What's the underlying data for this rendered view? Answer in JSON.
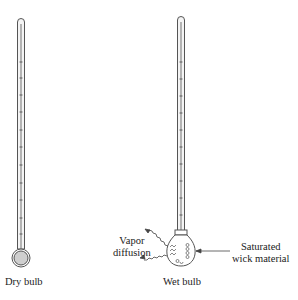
{
  "diagram": {
    "labels": {
      "dry_bulb": "Dry bulb",
      "wet_bulb": "Wet bulb",
      "vapor_line1": "Vapor",
      "vapor_line2": "diffusion",
      "wick_line1": "Saturated",
      "wick_line2": "wick material"
    },
    "colors": {
      "stroke": "#555555",
      "bulb_fill": "#cccccc",
      "text": "#222222"
    }
  }
}
